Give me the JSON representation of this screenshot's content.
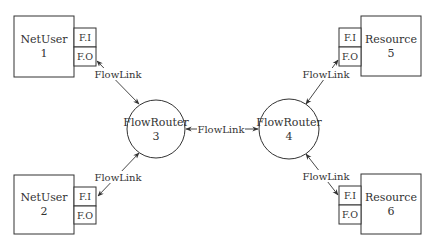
{
  "diagram": {
    "nodes": [
      {
        "id": "netuser1",
        "type": "NetUser",
        "name": "NetUser",
        "number": "1",
        "box": {
          "x": 14,
          "y": 16,
          "w": 60,
          "h": 61
        },
        "ports": [
          {
            "label": "F.I",
            "x": 74,
            "y": 28,
            "w": 22,
            "h": 19
          },
          {
            "label": "F.O",
            "x": 74,
            "y": 47,
            "w": 22,
            "h": 19
          }
        ]
      },
      {
        "id": "netuser2",
        "type": "NetUser",
        "name": "NetUser",
        "number": "2",
        "box": {
          "x": 14,
          "y": 175,
          "w": 60,
          "h": 59
        },
        "ports": [
          {
            "label": "F.I",
            "x": 74,
            "y": 187,
            "w": 22,
            "h": 19
          },
          {
            "label": "F.O",
            "x": 74,
            "y": 206,
            "w": 22,
            "h": 18
          }
        ]
      },
      {
        "id": "resource5",
        "type": "Resource",
        "name": "Resource",
        "number": "5",
        "box": {
          "x": 361,
          "y": 16,
          "w": 60,
          "h": 60
        },
        "ports": [
          {
            "label": "F.I",
            "x": 339,
            "y": 28,
            "w": 22,
            "h": 19
          },
          {
            "label": "F.O",
            "x": 339,
            "y": 47,
            "w": 22,
            "h": 19
          }
        ]
      },
      {
        "id": "resource6",
        "type": "Resource",
        "name": "Resource",
        "number": "6",
        "box": {
          "x": 361,
          "y": 174,
          "w": 60,
          "h": 60
        },
        "ports": [
          {
            "label": "F.I",
            "x": 339,
            "y": 186,
            "w": 22,
            "h": 19
          },
          {
            "label": "F.O",
            "x": 339,
            "y": 205,
            "w": 22,
            "h": 19
          }
        ]
      }
    ],
    "routers": [
      {
        "id": "flowrouter3",
        "name": "FlowRouter",
        "number": "3",
        "cx": 156,
        "cy": 129,
        "r": 29
      },
      {
        "id": "flowrouter4",
        "name": "FlowRouter",
        "number": "4",
        "cx": 289,
        "cy": 129,
        "r": 30
      }
    ],
    "links": [
      {
        "label": "FlowLink",
        "from": "netuser1.F.O",
        "to": "flowrouter3"
      },
      {
        "label": "FlowLink",
        "from": "flowrouter3",
        "to": "netuser2.F.I"
      },
      {
        "label": "FlowLink",
        "from": "flowrouter3",
        "to": "flowrouter4"
      },
      {
        "label": "FlowLink",
        "from": "flowrouter4",
        "to": "resource5.F.O"
      },
      {
        "label": "FlowLink",
        "from": "flowrouter4",
        "to": "resource6.F.I"
      }
    ]
  }
}
